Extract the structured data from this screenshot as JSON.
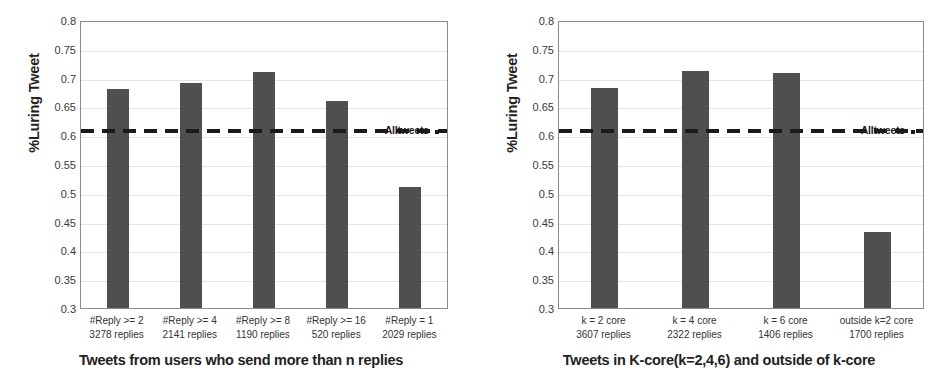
{
  "figure": {
    "background": "#ffffff",
    "bar_color": "#4f4f4f",
    "refline_color": "#1b1b1b",
    "grid_color": "#e3e3e3",
    "axis_color": "#8a8a8a"
  },
  "chart_data": [
    {
      "type": "bar",
      "title": "",
      "xlabel": "Tweets from users who send more than n replies",
      "ylabel": "%Luring Tweet",
      "ylim": [
        0.3,
        0.8
      ],
      "ytick_labels": [
        "0.8",
        "0.75",
        "0.7",
        "0.65",
        "0.6",
        "0.55",
        "0.5",
        "0.45",
        "0.4",
        "0.35",
        "0.3"
      ],
      "ytick_values": [
        0.8,
        0.75,
        0.7,
        0.65,
        0.6,
        0.55,
        0.5,
        0.45,
        0.4,
        0.35,
        0.3
      ],
      "grid": true,
      "legend_position": "inline-right",
      "categories": [
        "#Reply >= 2",
        "#Reply >= 4",
        "#Reply >= 8",
        "#Reply >= 16",
        "#Reply  =  1"
      ],
      "category_sublabels": [
        "3278 replies",
        "2141 replies",
        "1190 replies",
        "520 replies",
        "2029 replies"
      ],
      "values": [
        0.68,
        0.69,
        0.71,
        0.66,
        0.51
      ],
      "reference_line": {
        "label": "Alltweets",
        "value": 0.61,
        "style": "dashed"
      }
    },
    {
      "type": "bar",
      "title": "",
      "xlabel": "Tweets in K-core(k=2,4,6) and outside of k-core",
      "ylabel": "%Luring Tweet",
      "ylim": [
        0.3,
        0.8
      ],
      "ytick_labels": [
        "0.8",
        "0.75",
        "0.7",
        "0.65",
        "0.6",
        "0.55",
        "0.5",
        "0.45",
        "0.4",
        "0.35",
        "0.3"
      ],
      "ytick_values": [
        0.8,
        0.75,
        0.7,
        0.65,
        0.6,
        0.55,
        0.5,
        0.45,
        0.4,
        0.35,
        0.3
      ],
      "grid": true,
      "legend_position": "inline-right",
      "categories": [
        "k = 2 core",
        "k = 4 core",
        "k = 6 core",
        "outside k=2 core"
      ],
      "category_sublabels": [
        "3607 replies",
        "2322 replies",
        "1406 replies",
        "1700 replies"
      ],
      "values": [
        0.682,
        0.711,
        0.708,
        0.432
      ],
      "reference_line": {
        "label": "Alltweets",
        "value": 0.61,
        "style": "dashed"
      }
    }
  ]
}
